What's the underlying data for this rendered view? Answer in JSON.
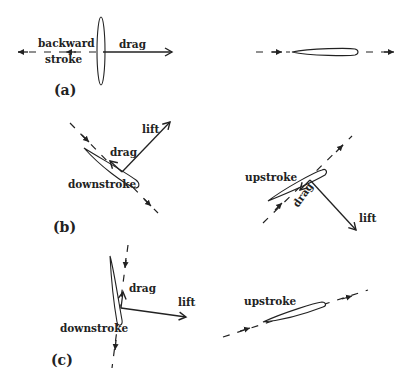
{
  "diagram": {
    "panels": [
      {
        "id": "a",
        "label": "(a)",
        "left": {
          "stroke_label_line1": "backward",
          "stroke_label_line2": "stroke",
          "force_labels": [
            "drag"
          ]
        },
        "right": {
          "description": "feathered wing moving forward, no label"
        }
      },
      {
        "id": "b",
        "label": "(b)",
        "left": {
          "stroke_label": "downstroke",
          "force_labels": [
            "drag",
            "lift"
          ]
        },
        "right": {
          "stroke_label": "upstroke",
          "force_labels": [
            "drag",
            "lift"
          ]
        }
      },
      {
        "id": "c",
        "label": "(c)",
        "left": {
          "stroke_label": "downstroke",
          "force_labels": [
            "drag",
            "lift"
          ]
        },
        "right": {
          "stroke_label": "upstroke"
        }
      }
    ]
  },
  "labels": {
    "a_backward": "backward",
    "a_stroke": "stroke",
    "a_drag": "drag",
    "a_panel": "(a)",
    "b_lift": "lift",
    "b_drag": "drag",
    "b_downstroke": "downstroke",
    "b_panel": "(b)",
    "b_upstroke": "upstroke",
    "b_up_drag": "drag",
    "b_up_lift": "lift",
    "c_drag": "drag",
    "c_lift": "lift",
    "c_downstroke": "downstroke",
    "c_panel": "(c)",
    "c_upstroke": "upstroke"
  }
}
